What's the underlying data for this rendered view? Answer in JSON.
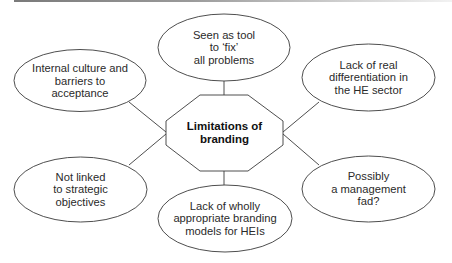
{
  "diagram": {
    "type": "mind-map",
    "center": {
      "label": "Limitations of\nbranding",
      "shape": "octagon"
    },
    "nodes": [
      {
        "id": "top",
        "label": "Seen as tool\nto ‘fix’\nall problems"
      },
      {
        "id": "top-left",
        "label": "Internal culture and\nbarriers to\nacceptance"
      },
      {
        "id": "top-right",
        "label": "Lack of real\ndifferentiation in\nthe HE sector"
      },
      {
        "id": "bottom-left",
        "label": "Not linked\nto strategic\nobjectives"
      },
      {
        "id": "bottom-right",
        "label": "Possibly\na management\nfad?"
      },
      {
        "id": "bottom",
        "label": "Lack of wholly\nappropriate branding\nmodels for HEIs"
      }
    ],
    "colors": {
      "stroke": "#3a3a3a",
      "fill": "#ffffff",
      "text": "#2a2a2a"
    }
  }
}
